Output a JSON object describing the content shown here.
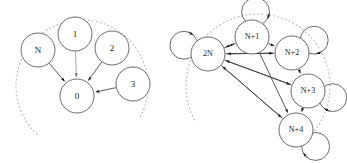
{
  "figure": {
    "background_color": "#ffffff",
    "node_stroke_color": "#5a5a5a",
    "edge_color": "#3d3d3d",
    "dotted_arc_color": "#b9b4b0",
    "label_color": "#1a1a1a"
  },
  "diagrams": [
    {
      "id": "left-diagram",
      "name": "hub-convergence-diagram",
      "description": "Nodes N, 1, 2, 3 each send a directed edge into central node 0; a dotted arc suggests omitted nodes.",
      "nodes": [
        {
          "id": "N",
          "label": "N",
          "cx": 38,
          "cy": 50,
          "r": 17
        },
        {
          "id": "1",
          "label": "1",
          "cx": 75,
          "cy": 34,
          "r": 17
        },
        {
          "id": "2",
          "label": "2",
          "cx": 112,
          "cy": 48,
          "r": 17
        },
        {
          "id": "3",
          "label": "3",
          "cx": 133,
          "cy": 84,
          "r": 17
        },
        {
          "id": "0",
          "label": "0",
          "cx": 77,
          "cy": 96,
          "r": 17
        }
      ],
      "edges": [
        {
          "from": "N",
          "to": "0",
          "arrow": "to",
          "style": "solid"
        },
        {
          "from": "1",
          "to": "0",
          "arrow": "to",
          "style": "light"
        },
        {
          "from": "2",
          "to": "0",
          "arrow": "to",
          "style": "solid"
        },
        {
          "from": "3",
          "to": "0",
          "arrow": "to",
          "style": "solid"
        }
      ],
      "dotted_arc": {
        "cx": 82,
        "cy": 86,
        "r": 66,
        "start_angle_deg": 133,
        "end_angle_deg": 28
      }
    },
    {
      "id": "right-diagram",
      "name": "fully-connected-ring-diagram",
      "description": "Nodes 2N, N+1, N+2, N+3, N+4 each carry a self loop, are linked around a ring, and all feed directed edges back to node 2N; a dotted arc suggests omitted nodes.",
      "nodes": [
        {
          "id": "2N",
          "label": "2N",
          "cx": 208,
          "cy": 54,
          "r": 17,
          "loop_angle_deg": 200
        },
        {
          "id": "N+1",
          "label": "N+1",
          "cx": 252,
          "cy": 37,
          "r": 17,
          "loop_angle_deg": 278
        },
        {
          "id": "N+2",
          "label": "N+2",
          "cx": 292,
          "cy": 53,
          "r": 17,
          "loop_angle_deg": 330
        },
        {
          "id": "N+3",
          "label": "N+3",
          "cx": 308,
          "cy": 91,
          "r": 17,
          "loop_angle_deg": 15
        },
        {
          "id": "N+4",
          "label": "N+4",
          "cx": 296,
          "cy": 130,
          "r": 17,
          "loop_angle_deg": 40
        }
      ],
      "edges": [
        {
          "from": "2N",
          "to": "N+1",
          "arrow": "to",
          "style": "solid"
        },
        {
          "from": "N+1",
          "to": "N+2",
          "arrow": "to",
          "style": "solid"
        },
        {
          "from": "N+2",
          "to": "N+3",
          "arrow": "to",
          "style": "solid"
        },
        {
          "from": "N+3",
          "to": "N+4",
          "arrow": "to",
          "style": "solid"
        },
        {
          "from": "N+1",
          "to": "2N",
          "arrow": "to",
          "style": "solid"
        },
        {
          "from": "N+2",
          "to": "2N",
          "arrow": "to",
          "style": "solid"
        },
        {
          "from": "N+3",
          "to": "2N",
          "arrow": "to",
          "style": "solid"
        },
        {
          "from": "N+4",
          "to": "2N",
          "arrow": "to",
          "style": "solid"
        },
        {
          "from": "2N",
          "to": "N+2",
          "arrow": "to",
          "style": "solid"
        },
        {
          "from": "2N",
          "to": "N+3",
          "arrow": "to",
          "style": "solid"
        },
        {
          "from": "2N",
          "to": "N+4",
          "arrow": "to",
          "style": "solid"
        },
        {
          "from": "N+1",
          "to": "N+4",
          "arrow": "to",
          "style": "solid"
        }
      ],
      "self_loops": [
        "2N",
        "N+1",
        "N+2",
        "N+3",
        "N+4"
      ],
      "dotted_arc": {
        "cx": 258,
        "cy": 86,
        "r": 72,
        "start_angle_deg": 152,
        "end_angle_deg": 40
      }
    }
  ]
}
